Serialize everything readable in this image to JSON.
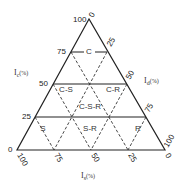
{
  "diagram": {
    "type": "ternary",
    "axes": {
      "left": {
        "label": "I",
        "sub": "c",
        "unit": "(%)"
      },
      "right": {
        "label": "I",
        "sub": "d",
        "unit": "(%)"
      },
      "bottom": {
        "label": "I",
        "sub": "s",
        "unit": "(%)"
      }
    },
    "left_ticks": [
      "100",
      "75",
      "50",
      "25",
      "0"
    ],
    "right_ticks": [
      "0",
      "25",
      "50",
      "75",
      "100"
    ],
    "bottom_ticks": [
      "100",
      "75",
      "50",
      "25",
      "0"
    ],
    "regions": [
      "C",
      "C-S",
      "C-R",
      "C-S-R",
      "S",
      "S-R",
      "R"
    ]
  }
}
